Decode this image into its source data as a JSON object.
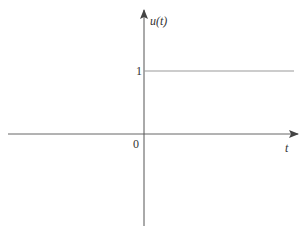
{
  "diagram": {
    "y_axis_label": "u(t)",
    "y_axis_label_func": "u",
    "y_axis_label_var": "t",
    "x_axis_label": "t",
    "origin_label": "0",
    "level_label": "1",
    "colors": {
      "axis": "#555555",
      "step": "#888888",
      "text": "#333333"
    }
  }
}
